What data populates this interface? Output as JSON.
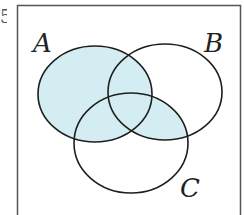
{
  "diagram": {
    "type": "venn",
    "sets": [
      {
        "name": "A",
        "cx": 95,
        "cy": 94,
        "rx": 57,
        "ry": 48
      },
      {
        "name": "B",
        "cx": 165,
        "cy": 92,
        "rx": 57,
        "ry": 48
      },
      {
        "name": "C",
        "cx": 131,
        "cy": 143,
        "rx": 57,
        "ry": 50
      }
    ],
    "labels": {
      "a": "A",
      "b": "B",
      "c": "C"
    },
    "shaded_region": "A ∪ (B ∩ C)",
    "colors": {
      "shade": "#d4edf3",
      "stroke": "#1e1e1e",
      "frame": "#555555",
      "background": "#ffffff"
    },
    "edge_fragment": "5"
  }
}
